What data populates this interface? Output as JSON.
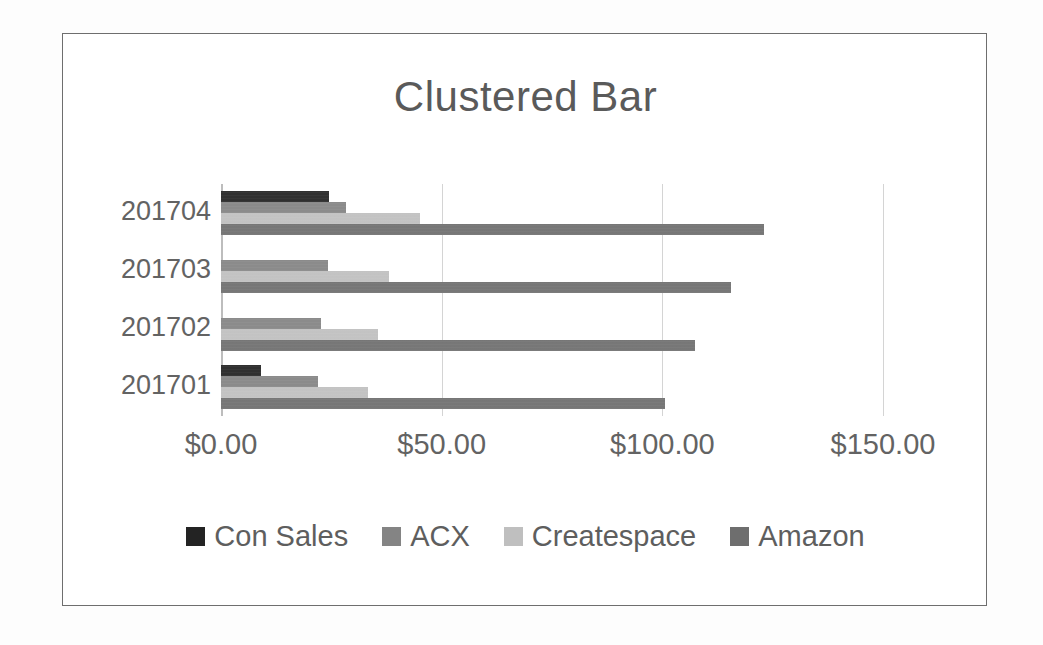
{
  "chart_data": {
    "type": "bar",
    "orientation": "horizontal",
    "title": "Clustered Bar",
    "xlabel": "",
    "ylabel": "",
    "categories": [
      "201701",
      "201702",
      "201703",
      "201704"
    ],
    "category_order_top_to_bottom": [
      "201704",
      "201703",
      "201702",
      "201701"
    ],
    "series": [
      {
        "name": "Con Sales",
        "color": "#232323",
        "values": [
          9.0,
          0.0,
          0.0,
          24.5
        ]
      },
      {
        "name": "ACX",
        "color": "#848484",
        "values": [
          22.0,
          22.7,
          24.3,
          28.4
        ]
      },
      {
        "name": "Createspace",
        "color": "#bfbfbf",
        "values": [
          33.3,
          35.6,
          38.0,
          45.0
        ]
      },
      {
        "name": "Amazon",
        "color": "#6e6e6e",
        "values": [
          100.5,
          107.3,
          115.6,
          123.0
        ]
      }
    ],
    "xlim": [
      0,
      150
    ],
    "xticks": [
      0,
      50,
      100,
      150
    ],
    "xtick_labels": [
      "$0.00",
      "$50.00",
      "$100.00",
      "$150.00"
    ],
    "grid": true,
    "grid_axis": "x",
    "legend_position": "bottom",
    "legend_entries": [
      "Con Sales",
      "ACX",
      "Createspace",
      "Amazon"
    ]
  },
  "frame": {
    "border_color": "#6e6e6e",
    "background": "#ffffff"
  }
}
